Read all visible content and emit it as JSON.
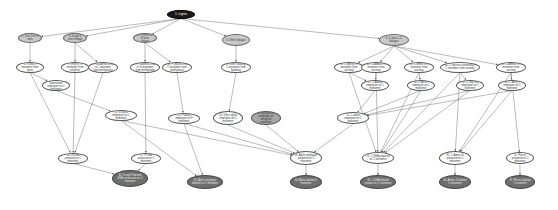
{
  "graph": {
    "type": "directed-flow-diagram",
    "colors": {
      "root": "#1a1a1a",
      "group": "#c8c8c8",
      "process": "#ffffff",
      "highlight": "#a6a6a6",
      "result": "#6e6e6e",
      "edge": "#777777"
    },
    "nodes": [
      {
        "id": "n1",
        "label": "1. Lignin",
        "kind": "root",
        "x": 181,
        "y": 14,
        "w": 28,
        "h": 9
      },
      {
        "id": "n2",
        "label": "2. G or S or H units",
        "kind": "group",
        "x": 30,
        "y": 38,
        "w": 24,
        "h": 10
      },
      {
        "id": "n3",
        "label": "3. G and S units linkage",
        "kind": "group",
        "x": 75,
        "y": 38,
        "w": 24,
        "h": 10
      },
      {
        "id": "n4",
        "label": "4. F and G or H units linkage",
        "kind": "group",
        "x": 145,
        "y": 38,
        "w": 24,
        "h": 10
      },
      {
        "id": "n5",
        "label": "5. Other linkages",
        "kind": "group",
        "x": 236,
        "y": 40,
        "w": 28,
        "h": 12
      },
      {
        "id": "n6",
        "label": "6. C units C-C linkages",
        "kind": "group",
        "x": 394,
        "y": 40,
        "w": 30,
        "h": 12
      },
      {
        "id": "n7",
        "label": "6. G and S monomer from lignin",
        "kind": "process",
        "x": 30,
        "y": 67,
        "w": 28,
        "h": 11
      },
      {
        "id": "n8",
        "label": "7. Ethyl G C monomer from ethylene",
        "kind": "process",
        "x": 75,
        "y": 67,
        "w": 28,
        "h": 11
      },
      {
        "id": "n9",
        "label": "8. G-labeled DHA in C monomer from methylation",
        "kind": "process",
        "x": 103,
        "y": 67,
        "w": 30,
        "h": 11
      },
      {
        "id": "n10",
        "label": "9. F-labeled DHA in G monomer from methylation",
        "kind": "process",
        "x": 145,
        "y": 67,
        "w": 30,
        "h": 11
      },
      {
        "id": "n11",
        "label": "10. F-linked DHA C monomer from methylation",
        "kind": "process",
        "x": 177,
        "y": 67,
        "w": 30,
        "h": 11
      },
      {
        "id": "n12",
        "label": "5. Other carbonyl C monomer from lipidizing",
        "kind": "process",
        "x": 236,
        "y": 67,
        "w": 30,
        "h": 11
      },
      {
        "id": "n13",
        "label": "11. C-specific C monomer from existing",
        "kind": "process",
        "x": 349,
        "y": 67,
        "w": 30,
        "h": 11
      },
      {
        "id": "n14",
        "label": "12. C-added in C monomer from existing",
        "kind": "process",
        "x": 376,
        "y": 67,
        "w": 30,
        "h": 11
      },
      {
        "id": "n15",
        "label": "13. C amine in C monomer from existing",
        "kind": "process",
        "x": 419,
        "y": 67,
        "w": 30,
        "h": 11
      },
      {
        "id": "n16",
        "label": "14. C-Glycine-containing in C monomer from existing",
        "kind": "process",
        "x": 460,
        "y": 67,
        "w": 40,
        "h": 11
      },
      {
        "id": "n17",
        "label": "15. C-Amine in C monomer from existing",
        "kind": "process",
        "x": 511,
        "y": 67,
        "w": 30,
        "h": 11
      },
      {
        "id": "n18",
        "label": "16. G-Substitution employee on C monomer",
        "kind": "process",
        "x": 56,
        "y": 85,
        "w": 28,
        "h": 11
      },
      {
        "id": "n19",
        "label": "17. C-Added employee on C monomer",
        "kind": "process",
        "x": 375,
        "y": 85,
        "w": 28,
        "h": 11
      },
      {
        "id": "n20",
        "label": "18. C-Amine employee on C monomer",
        "kind": "process",
        "x": 421,
        "y": 85,
        "w": 28,
        "h": 11
      },
      {
        "id": "n21",
        "label": "19. C-Glycine employee on C monomer",
        "kind": "process",
        "x": 470,
        "y": 85,
        "w": 28,
        "h": 11
      },
      {
        "id": "n22",
        "label": "20. C-Amine employee on C monomer",
        "kind": "process",
        "x": 512,
        "y": 85,
        "w": 28,
        "h": 11
      },
      {
        "id": "n23",
        "label": "21. G-alpha employee on C monomer",
        "kind": "process",
        "x": 121,
        "y": 115,
        "w": 32,
        "h": 11
      },
      {
        "id": "n24",
        "label": "22. F-alpha employee on F monomer",
        "kind": "process",
        "x": 184,
        "y": 118,
        "w": 32,
        "h": 11
      },
      {
        "id": "n25",
        "label": "23. Other alpha employee on C monomer",
        "kind": "process",
        "x": 228,
        "y": 118,
        "w": 30,
        "h": 14
      },
      {
        "id": "n26",
        "label": "24. Background employee on designed monomer",
        "kind": "highlight",
        "x": 266,
        "y": 118,
        "w": 30,
        "h": 14
      },
      {
        "id": "n27",
        "label": "25. C-alpha employee on C monomer",
        "kind": "process",
        "x": 353,
        "y": 118,
        "w": 32,
        "h": 12
      },
      {
        "id": "n28",
        "label": "26. G DHA prepared on C monomer",
        "kind": "process",
        "x": 73,
        "y": 158,
        "w": 30,
        "h": 11
      },
      {
        "id": "n29",
        "label": "27. F DHA prepared on C monomer",
        "kind": "process",
        "x": 146,
        "y": 158,
        "w": 30,
        "h": 11
      },
      {
        "id": "n30",
        "label": "28. Alpha employee prepared on C monomer",
        "kind": "process",
        "x": 306,
        "y": 158,
        "w": 32,
        "h": 14
      },
      {
        "id": "n31",
        "label": "29. C DHA prepared on C monomer",
        "kind": "process",
        "x": 378,
        "y": 158,
        "w": 32,
        "h": 12
      },
      {
        "id": "n32",
        "label": "30. C-Amine-G prepared on C monomer",
        "kind": "process",
        "x": 455,
        "y": 158,
        "w": 32,
        "h": 14
      },
      {
        "id": "n33",
        "label": "31. Pieces prepared on C monomer",
        "kind": "process",
        "x": 520,
        "y": 158,
        "w": 28,
        "h": 12
      },
      {
        "id": "n34",
        "label": "32. G and F-labeled DHA condensate on C monomer",
        "kind": "result",
        "x": 130,
        "y": 178,
        "w": 36,
        "h": 17
      },
      {
        "id": "n35",
        "label": "33. Alpha employee labeled on C monomer",
        "kind": "result",
        "x": 205,
        "y": 182,
        "w": 36,
        "h": 14
      },
      {
        "id": "n36",
        "label": "34. Alpha-labeled C monomer",
        "kind": "result",
        "x": 306,
        "y": 182,
        "w": 32,
        "h": 14
      },
      {
        "id": "n37",
        "label": "35. C DHA labeled product on C monomer",
        "kind": "result",
        "x": 378,
        "y": 182,
        "w": 36,
        "h": 14
      },
      {
        "id": "n38",
        "label": "36. Amine-G labeled C monomer",
        "kind": "result",
        "x": 455,
        "y": 182,
        "w": 32,
        "h": 14
      },
      {
        "id": "n39",
        "label": "37. Pieces labeled C monomer",
        "kind": "result",
        "x": 520,
        "y": 182,
        "w": 30,
        "h": 14
      }
    ],
    "edges": [
      [
        "n1",
        "n2"
      ],
      [
        "n1",
        "n3"
      ],
      [
        "n1",
        "n4"
      ],
      [
        "n1",
        "n5"
      ],
      [
        "n1",
        "n6"
      ],
      [
        "n2",
        "n7"
      ],
      [
        "n3",
        "n8"
      ],
      [
        "n3",
        "n9"
      ],
      [
        "n4",
        "n10"
      ],
      [
        "n4",
        "n11"
      ],
      [
        "n5",
        "n12"
      ],
      [
        "n6",
        "n13"
      ],
      [
        "n6",
        "n14"
      ],
      [
        "n6",
        "n15"
      ],
      [
        "n6",
        "n16"
      ],
      [
        "n6",
        "n17"
      ],
      [
        "n7",
        "n18"
      ],
      [
        "n13",
        "n19"
      ],
      [
        "n14",
        "n19"
      ],
      [
        "n15",
        "n20"
      ],
      [
        "n16",
        "n21"
      ],
      [
        "n17",
        "n22"
      ],
      [
        "n18",
        "n23"
      ],
      [
        "n11",
        "n24"
      ],
      [
        "n12",
        "n25"
      ],
      [
        "n19",
        "n27"
      ],
      [
        "n20",
        "n27"
      ],
      [
        "n21",
        "n27"
      ],
      [
        "n22",
        "n27"
      ],
      [
        "n7",
        "n28"
      ],
      [
        "n8",
        "n28"
      ],
      [
        "n9",
        "n28"
      ],
      [
        "n10",
        "n29"
      ],
      [
        "n23",
        "n30"
      ],
      [
        "n24",
        "n30"
      ],
      [
        "n25",
        "n30"
      ],
      [
        "n26",
        "n30"
      ],
      [
        "n27",
        "n30"
      ],
      [
        "n13",
        "n31"
      ],
      [
        "n14",
        "n31"
      ],
      [
        "n15",
        "n31"
      ],
      [
        "n16",
        "n31"
      ],
      [
        "n20",
        "n31"
      ],
      [
        "n21",
        "n31"
      ],
      [
        "n16",
        "n32"
      ],
      [
        "n17",
        "n32"
      ],
      [
        "n22",
        "n32"
      ],
      [
        "n17",
        "n33"
      ],
      [
        "n28",
        "n34"
      ],
      [
        "n29",
        "n34"
      ],
      [
        "n30",
        "n36"
      ],
      [
        "n31",
        "n37"
      ],
      [
        "n32",
        "n38"
      ],
      [
        "n33",
        "n39"
      ],
      [
        "n24",
        "n35"
      ],
      [
        "n23",
        "n35"
      ]
    ]
  }
}
